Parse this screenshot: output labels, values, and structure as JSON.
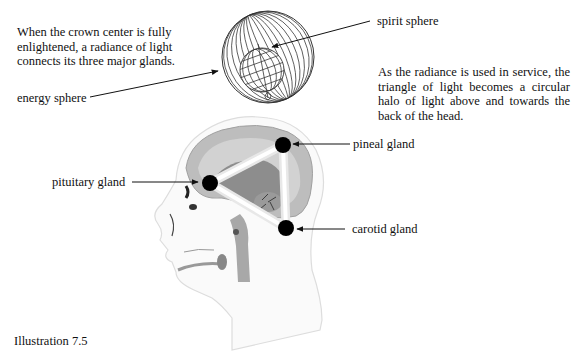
{
  "captions": {
    "intro": "When the crown center is fully enlightened, a radiance of light connects its three major glands.",
    "service": "As the radiance is used in service, the triangle of light becomes a circular halo of light above and towards the back of the head.",
    "illustration": "Illustration 7.5"
  },
  "labels": {
    "spirit_sphere": "spirit sphere",
    "energy_sphere": "energy sphere",
    "pineal_gland": "pineal gland",
    "pituitary_gland": "pituitary gland",
    "carotid_gland": "carotid gland"
  },
  "diagram": {
    "nodes": [
      {
        "id": "pineal",
        "label": "pineal gland",
        "x": 283,
        "y": 145
      },
      {
        "id": "pituitary",
        "label": "pituitary gland",
        "x": 210,
        "y": 183
      },
      {
        "id": "carotid",
        "label": "carotid gland",
        "x": 286,
        "y": 228
      }
    ],
    "edges": [
      {
        "from": "pituitary",
        "to": "pineal",
        "style": "light-beam"
      },
      {
        "from": "pineal",
        "to": "carotid",
        "style": "light-beam"
      },
      {
        "from": "carotid",
        "to": "pituitary",
        "style": "light-beam"
      }
    ],
    "spheres": [
      {
        "id": "energy",
        "label": "energy sphere"
      },
      {
        "id": "spirit",
        "label": "spirit sphere"
      }
    ]
  }
}
